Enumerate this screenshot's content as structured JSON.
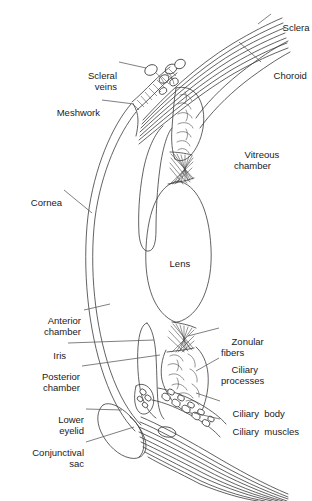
{
  "figure": {
    "background_color": "#ffffff",
    "line_color": "#3a3a3a",
    "text_color": "#1a1a1a",
    "width_px": 312,
    "height_px": 501
  },
  "labels": [
    {
      "id": "sclera",
      "text": "Sclera",
      "align": "left",
      "x": 272,
      "y": 10,
      "w": 40
    },
    {
      "id": "choroid",
      "text": "Choroid",
      "align": "left",
      "x": 263,
      "y": 58,
      "w": 48
    },
    {
      "id": "scleral_veins",
      "text": "Scleral\nveins",
      "align": "right",
      "x": 62,
      "y": 58,
      "w": 55
    },
    {
      "id": "meshwork",
      "text": "Meshwork",
      "align": "right",
      "x": 38,
      "y": 95,
      "w": 62
    },
    {
      "id": "vitreous_chamber",
      "text": "Vitreous\nchamber",
      "align": "left",
      "x": 234,
      "y": 137,
      "w": 66
    },
    {
      "id": "cornea",
      "text": "Cornea",
      "align": "right",
      "x": 16,
      "y": 185,
      "w": 46
    },
    {
      "id": "lens",
      "text": "Lens",
      "align": "center",
      "x": 159,
      "y": 246,
      "w": 30
    },
    {
      "id": "anterior_chamber",
      "text": "Anterior\nchamber",
      "align": "right",
      "x": 18,
      "y": 303,
      "w": 63
    },
    {
      "id": "zonular_fibers",
      "text": "Zonular\nfibers",
      "align": "left",
      "x": 221,
      "y": 324,
      "w": 54
    },
    {
      "id": "iris",
      "text": "Iris",
      "align": "right",
      "x": 42,
      "y": 338,
      "w": 24
    },
    {
      "id": "ciliary_processes",
      "text": "Ciliary\nprocesses",
      "align": "left",
      "x": 221,
      "y": 352,
      "w": 68
    },
    {
      "id": "posterior_chamber",
      "text": "Posterior\nchamber",
      "align": "right",
      "x": 16,
      "y": 359,
      "w": 64
    },
    {
      "id": "lower_eyelid",
      "text": "Lower\neyelid",
      "align": "right",
      "x": 40,
      "y": 402,
      "w": 44
    },
    {
      "id": "ciliary_body",
      "text": "Ciliary  body",
      "align": "left",
      "x": 222,
      "y": 397,
      "w": 72
    },
    {
      "id": "ciliary_muscles",
      "text": "Ciliary  muscles",
      "align": "left",
      "x": 222,
      "y": 415,
      "w": 82
    },
    {
      "id": "conjunctival_sac",
      "text": "Conjunctival\nsac",
      "align": "right",
      "x": 12,
      "y": 435,
      "w": 72
    }
  ],
  "structures": [
    {
      "id": "sclera-upper",
      "name": "sclera-upper-fibers"
    },
    {
      "id": "sclera-lower",
      "name": "sclera-lower-fibers"
    },
    {
      "id": "choroid-layer",
      "name": "choroid-layer"
    },
    {
      "id": "cornea-layer",
      "name": "cornea-layer"
    },
    {
      "id": "lens-body",
      "name": "lens-body"
    },
    {
      "id": "iris-upper",
      "name": "iris-upper"
    },
    {
      "id": "iris-lower",
      "name": "iris-lower"
    },
    {
      "id": "trabecular-meshwork",
      "name": "trabecular-meshwork"
    },
    {
      "id": "scleral-veins-group",
      "name": "scleral-veins"
    },
    {
      "id": "ciliary-body-upper",
      "name": "ciliary-body-upper"
    },
    {
      "id": "ciliary-body-lower",
      "name": "ciliary-body-lower"
    },
    {
      "id": "zonular-fibers-upper",
      "name": "zonular-fibers-upper"
    },
    {
      "id": "zonular-fibers-lower",
      "name": "zonular-fibers-lower"
    },
    {
      "id": "ciliary-muscle-mass",
      "name": "ciliary-muscle-mass"
    },
    {
      "id": "lower-eyelid-shape",
      "name": "lower-eyelid"
    },
    {
      "id": "conjunctival-sac-shape",
      "name": "conjunctival-sac"
    }
  ]
}
